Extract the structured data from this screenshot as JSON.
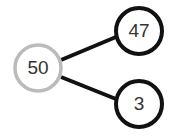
{
  "diagram": {
    "type": "number-bond",
    "whole": {
      "value": "50",
      "stroke": "#bbbbbb"
    },
    "parts": [
      {
        "value": "47",
        "stroke": "#111111"
      },
      {
        "value": "3",
        "stroke": "#111111"
      }
    ],
    "line_color": "#111111"
  }
}
